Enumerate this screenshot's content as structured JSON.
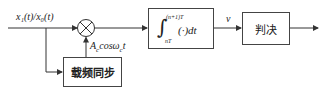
{
  "diagram": {
    "input_signal": {
      "text": "x₁(t)/x₀(t)"
    },
    "multiplier": {
      "symbol": "⊗"
    },
    "carrier_label": {
      "main": "A",
      "sub": "c",
      "rest": "cosω",
      "sub2": "c",
      "tail": "t"
    },
    "integrator": {
      "upper_limit": "(n+1)T",
      "lower_limit": "nT",
      "body": "(·)dt",
      "integral_sign": "∫"
    },
    "integrator_output_label": "v",
    "decision_block": {
      "label": "判决"
    },
    "carrier_sync_block": {
      "label": "载频同步"
    },
    "colors": {
      "line": "#333333",
      "box_border": "#444444",
      "background": "#ffffff"
    }
  }
}
